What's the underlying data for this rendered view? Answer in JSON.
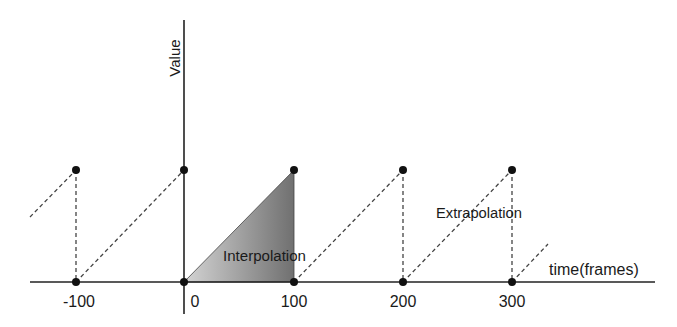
{
  "diagram": {
    "y_axis_label": "Value",
    "x_axis_label": "time(frames)",
    "tick_labels": [
      "-100",
      "0",
      "100",
      "200",
      "300"
    ],
    "region_labels": {
      "interpolation": "Interpolation",
      "extrapolation": "Extrapolation"
    },
    "colors": {
      "axis": "#222222",
      "dash": "#444444",
      "point": "#111111",
      "fill_light": "#cfcfcf",
      "fill_dark": "#7a7a7a"
    }
  }
}
